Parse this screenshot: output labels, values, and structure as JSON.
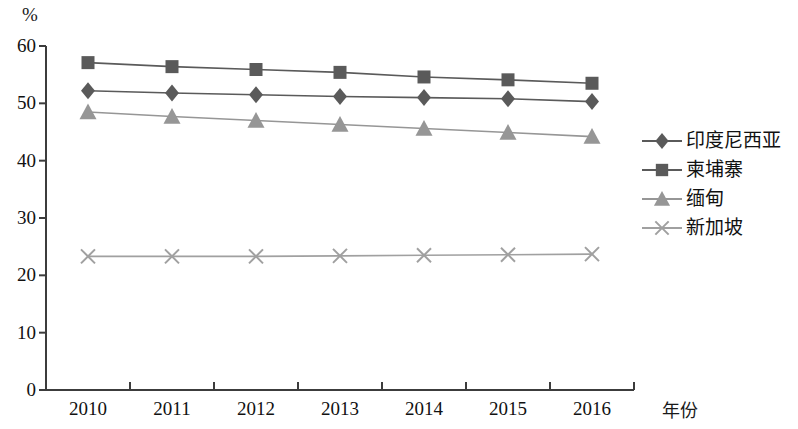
{
  "chart_data": {
    "type": "line",
    "title": "",
    "subtitle": "",
    "xlabel": "年份",
    "ylabel": "%",
    "ylim": [
      0,
      60
    ],
    "yticks": [
      0,
      10,
      20,
      30,
      40,
      50,
      60
    ],
    "grid": false,
    "legend_position": "right",
    "categories": [
      "2010",
      "2011",
      "2012",
      "2013",
      "2014",
      "2015",
      "2016"
    ],
    "series": [
      {
        "name": "印度尼西亚",
        "marker": "diamond",
        "color": "#5a5a5a",
        "values": [
          52.2,
          51.8,
          51.5,
          51.2,
          51.0,
          50.8,
          50.3
        ]
      },
      {
        "name": "柬埔寨",
        "marker": "square",
        "color": "#5a5a5a",
        "values": [
          57.1,
          56.4,
          55.9,
          55.4,
          54.6,
          54.1,
          53.5
        ]
      },
      {
        "name": "缅甸",
        "marker": "triangle",
        "color": "#969696",
        "values": [
          48.5,
          47.7,
          47.0,
          46.3,
          45.6,
          44.9,
          44.2
        ]
      },
      {
        "name": "新加坡",
        "marker": "x",
        "color": "#a0a0a0",
        "values": [
          23.3,
          23.3,
          23.3,
          23.4,
          23.5,
          23.6,
          23.7
        ]
      }
    ]
  },
  "axis": {
    "unit_label": "%",
    "x_title": "年份",
    "axis_color": "#3c3c3c"
  }
}
